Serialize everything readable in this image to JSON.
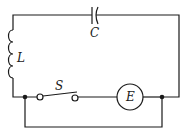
{
  "diagram": {
    "type": "circuit",
    "components": [
      {
        "id": "L",
        "label": "L",
        "kind": "inductor"
      },
      {
        "id": "C",
        "label": "C",
        "kind": "capacitor"
      },
      {
        "id": "S",
        "label": "S",
        "kind": "switch",
        "state": "open"
      },
      {
        "id": "E",
        "label": "E",
        "kind": "source"
      }
    ],
    "colors": {
      "line": "#1a1a1a",
      "background": "#ffffff"
    }
  }
}
